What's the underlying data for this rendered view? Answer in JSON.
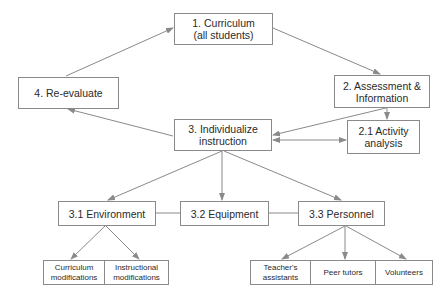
{
  "diagram": {
    "nodes": {
      "curriculum": {
        "label": "1. Curriculum\n(all students)"
      },
      "assessment": {
        "label": "2. Assessment &\nInformation"
      },
      "activity_analysis": {
        "label": "2.1 Activity\nanalysis"
      },
      "individualize": {
        "label": "3. Individualize\ninstruction"
      },
      "reevaluate": {
        "label": "4. Re-evaluate"
      },
      "environment": {
        "label": "3.1 Environment"
      },
      "equipment": {
        "label": "3.2 Equipment"
      },
      "personnel": {
        "label": "3.3 Personnel"
      }
    },
    "environment_children": [
      {
        "label": "Curriculum\nmodifications"
      },
      {
        "label": "Instructional\nmodifications"
      }
    ],
    "personnel_children": [
      {
        "label": "Teacher's\nassistants"
      },
      {
        "label": "Peer tutors"
      },
      {
        "label": "Volunteers"
      }
    ],
    "edges": [
      {
        "from": "1. Curriculum",
        "to": "2. Assessment & Information"
      },
      {
        "from": "2. Assessment & Information",
        "to": "2.1 Activity analysis"
      },
      {
        "from": "2. Assessment & Information",
        "to": "3. Individualize instruction"
      },
      {
        "from": "3. Individualize instruction",
        "to": "2.1 Activity analysis",
        "bidirectional": true
      },
      {
        "from": "3. Individualize instruction",
        "to": "4. Re-evaluate"
      },
      {
        "from": "4. Re-evaluate",
        "to": "1. Curriculum"
      },
      {
        "from": "3. Individualize instruction",
        "to": "3.1 Environment"
      },
      {
        "from": "3. Individualize instruction",
        "to": "3.2 Equipment"
      },
      {
        "from": "3. Individualize instruction",
        "to": "3.3 Personnel"
      },
      {
        "from": "3.1 Environment",
        "to": "Curriculum modifications"
      },
      {
        "from": "3.1 Environment",
        "to": "Instructional modifications"
      },
      {
        "from": "3.3 Personnel",
        "to": "Teacher's assistants"
      },
      {
        "from": "3.3 Personnel",
        "to": "Peer tutors"
      },
      {
        "from": "3.3 Personnel",
        "to": "Volunteers"
      }
    ],
    "colors": {
      "line": "#8a8a8a",
      "text": "#2a2a2a",
      "background": "#ffffff"
    }
  }
}
